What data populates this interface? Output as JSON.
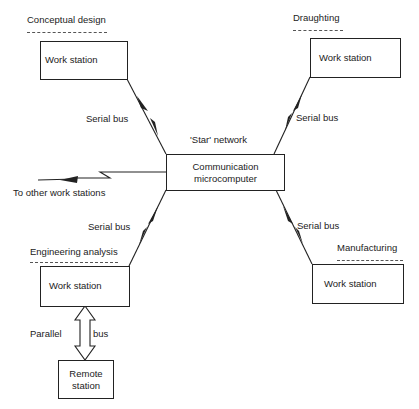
{
  "diagram": {
    "type": "star-network",
    "network_label": "'Star' network",
    "hub": {
      "label_line1": "Communication",
      "label_line2": "microcomputer"
    },
    "nodes": [
      {
        "id": "conceptual",
        "section_label": "Conceptual design",
        "box_label": "Work station",
        "link_label": "Serial bus"
      },
      {
        "id": "draughting",
        "section_label": "Draughting",
        "box_label": "Work station",
        "link_label": "Serial bus"
      },
      {
        "id": "engineering",
        "section_label": "Engineering analysis",
        "box_label": "Work station",
        "link_label": "Serial bus"
      },
      {
        "id": "manufacturing",
        "section_label": "Manufacturing",
        "box_label": "Work station",
        "link_label": "Serial bus"
      }
    ],
    "external_link": {
      "label": "To other work stations"
    },
    "remote": {
      "label_line1": "Remote",
      "label_line2": "station",
      "link_label_left": "Parallel",
      "link_label_right": "bus"
    }
  },
  "colors": {
    "ink": "#222222",
    "background": "#ffffff"
  }
}
